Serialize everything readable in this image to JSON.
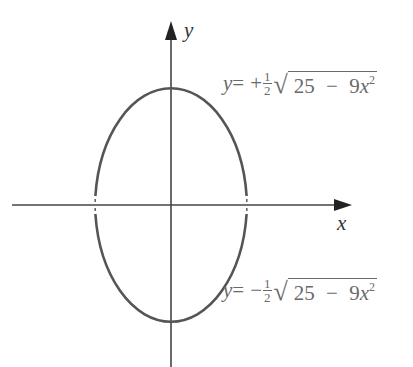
{
  "diagram": {
    "axes": {
      "x_label": "x",
      "y_label": "y"
    },
    "curve": {
      "type": "ellipse",
      "equation": "4y^2 + 9x^2 = 25",
      "center": [
        0,
        0
      ],
      "stroke_color": "#555555",
      "axis_color": "#333333"
    },
    "upper_equation": {
      "lhs": "y",
      "eq": "=",
      "sign": "+",
      "frac_num": "1",
      "frac_den": "2",
      "radicand_a": "25",
      "minus": "−",
      "radicand_b": "9",
      "radicand_var": "x",
      "exponent": "2"
    },
    "lower_equation": {
      "lhs": "y",
      "eq": "=",
      "sign": "−",
      "frac_num": "1",
      "frac_den": "2",
      "radicand_a": "25",
      "minus": "−",
      "radicand_b": "9",
      "radicand_var": "x",
      "exponent": "2"
    }
  }
}
